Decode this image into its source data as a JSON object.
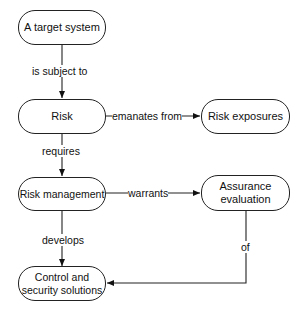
{
  "nodes": {
    "target": "A target system",
    "risk": "Risk",
    "exposures": "Risk exposures",
    "management": "Risk management",
    "assurance_l1": "Assurance",
    "assurance_l2": "evaluation",
    "control_l1": "Control and",
    "control_l2": "security solutions"
  },
  "edges": {
    "subject": "is subject to",
    "emanates": "emanates from",
    "requires": "requires",
    "warrants": "warrants",
    "develops": "develops",
    "of": "of"
  }
}
